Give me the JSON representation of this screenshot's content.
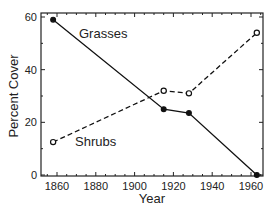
{
  "chart_data": {
    "type": "line",
    "title": "",
    "xlabel": "Year",
    "ylabel": "Percent Cover",
    "xlim": [
      1850,
      1970
    ],
    "ylim": [
      0,
      60
    ],
    "x_ticks": [
      1860,
      1880,
      1900,
      1920,
      1940,
      1960
    ],
    "y_ticks": [
      0,
      20,
      40,
      60
    ],
    "grid": false,
    "legend": "inline labels",
    "series": [
      {
        "name": "Grasses",
        "style": "solid",
        "marker": "filled-circle",
        "color": "#111111",
        "x": [
          1858,
          1915,
          1928,
          1963
        ],
        "values": [
          59,
          25,
          23.5,
          0
        ]
      },
      {
        "name": "Shrubs",
        "style": "dashed",
        "marker": "open-circle",
        "color": "#111111",
        "x": [
          1858,
          1915,
          1928,
          1963
        ],
        "values": [
          12.5,
          32,
          31,
          54
        ]
      }
    ]
  },
  "labels": {
    "xlabel": "Year",
    "ylabel": "Percent Cover",
    "grasses": "Grasses",
    "shrubs": "Shrubs"
  }
}
